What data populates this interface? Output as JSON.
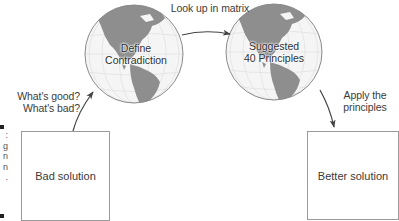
{
  "diagram": {
    "type": "process-flow",
    "nodes": [
      {
        "id": "bad",
        "shape": "box",
        "label": "Bad solution"
      },
      {
        "id": "define",
        "shape": "globe",
        "label_line1": "Define",
        "label_line2": "Contradiction"
      },
      {
        "id": "suggested",
        "shape": "globe",
        "label_line1": "Suggested",
        "label_line2": "40 Principles"
      },
      {
        "id": "better",
        "shape": "box",
        "label": "Better solution"
      }
    ],
    "edges": [
      {
        "from": "bad",
        "to": "define",
        "label_line1": "What's good?",
        "label_line2": "What's bad?"
      },
      {
        "from": "define",
        "to": "suggested",
        "label": "Look up in matrix"
      },
      {
        "from": "suggested",
        "to": "better",
        "label_line1": "Apply the",
        "label_line2": "principles"
      }
    ]
  },
  "edge_caption_fragments": [
    ":",
    "g",
    "n",
    "n",
    "."
  ],
  "colors": {
    "ocean": "#f4f4f4",
    "land": "#8e8e8e",
    "outline": "#8a8a8a",
    "arrow": "#444444",
    "box_border": "#9a9a9a"
  }
}
